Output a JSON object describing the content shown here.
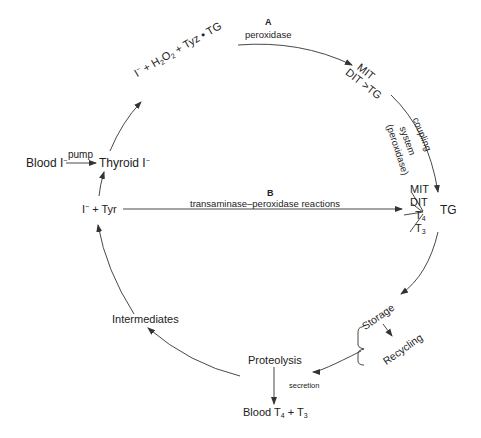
{
  "diagram": {
    "nodes": {
      "blood_iodide": "Blood I",
      "thyroid_iodide": "Thyroid I",
      "substrate_A": "I + H2O2 + Tyz • TG",
      "mit_dit_tg_top_mit": "MIT",
      "mit_dit_tg_top_dit": "DIT",
      "mit_dit_tg_top_tg": ">TG",
      "iodotyrosine_tg": {
        "mit": "MIT",
        "dit": "DIT",
        "t4": "T",
        "t4_sub": "4",
        "t3": "T",
        "t3_sub": "3",
        "tg": "TG"
      },
      "iodide_tyr": "I + Tyr",
      "storage": "Storage",
      "recycling": "Recycling",
      "proteolysis": "Proteolysis",
      "blood_t4_t3": {
        "prefix": "Blood T",
        "sub1": "4",
        "plus": " + T",
        "sub2": "3"
      },
      "intermediates": "Intermediates"
    },
    "edge_labels": {
      "pump": "pump",
      "pathway_a_letter": "A",
      "peroxidase": "peroxidase",
      "coupling": "coupling",
      "system": "system",
      "peroxidase_paren": "(peroxidase)",
      "pathway_b_letter": "B",
      "transaminase": "transaminase–peroxidase reactions",
      "secretion": "secretion"
    },
    "superscripts": {
      "minus": "−"
    },
    "colors": {
      "line": "#333333",
      "text": "#222222",
      "background": "#ffffff"
    }
  }
}
